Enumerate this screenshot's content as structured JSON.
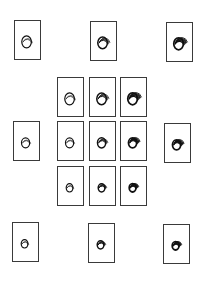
{
  "figure": {
    "outer_tiles": [
      {
        "id": "top-left",
        "x": 14,
        "y": 20,
        "arcs": 3,
        "weight": 0.9,
        "scale": 1.0
      },
      {
        "id": "top-center",
        "x": 90,
        "y": 21,
        "arcs": 5,
        "weight": 1.2,
        "scale": 1.0
      },
      {
        "id": "top-right",
        "x": 166,
        "y": 22,
        "arcs": 7,
        "weight": 1.5,
        "scale": 1.0
      },
      {
        "id": "middle-left",
        "x": 13,
        "y": 121,
        "arcs": 3,
        "weight": 0.9,
        "scale": 0.85
      },
      {
        "id": "middle-right",
        "x": 164,
        "y": 123,
        "arcs": 7,
        "weight": 1.5,
        "scale": 0.85
      },
      {
        "id": "bottom-left",
        "x": 12,
        "y": 222,
        "arcs": 3,
        "weight": 0.9,
        "scale": 0.7
      },
      {
        "id": "bottom-center",
        "x": 88,
        "y": 223,
        "arcs": 5,
        "weight": 1.2,
        "scale": 0.7
      },
      {
        "id": "bottom-right",
        "x": 163,
        "y": 224,
        "arcs": 7,
        "weight": 1.5,
        "scale": 0.7
      }
    ],
    "center_grid": [
      {
        "id": "grid-r1-c1",
        "x": 57,
        "y": 77,
        "arcs": 3,
        "weight": 0.9,
        "scale": 1.0
      },
      {
        "id": "grid-r1-c2",
        "x": 89,
        "y": 77,
        "arcs": 5,
        "weight": 1.2,
        "scale": 1.0
      },
      {
        "id": "grid-r1-c3",
        "x": 120,
        "y": 77,
        "arcs": 7,
        "weight": 1.5,
        "scale": 1.0
      },
      {
        "id": "grid-r2-c1",
        "x": 57,
        "y": 121,
        "arcs": 3,
        "weight": 0.9,
        "scale": 0.85
      },
      {
        "id": "grid-r2-c2",
        "x": 89,
        "y": 121,
        "arcs": 5,
        "weight": 1.2,
        "scale": 0.85
      },
      {
        "id": "grid-r2-c3",
        "x": 120,
        "y": 121,
        "arcs": 7,
        "weight": 1.5,
        "scale": 0.85
      },
      {
        "id": "grid-r3-c1",
        "x": 57,
        "y": 166,
        "arcs": 3,
        "weight": 0.9,
        "scale": 0.7
      },
      {
        "id": "grid-r3-c2",
        "x": 89,
        "y": 166,
        "arcs": 5,
        "weight": 1.2,
        "scale": 0.7
      },
      {
        "id": "grid-r3-c3",
        "x": 120,
        "y": 166,
        "arcs": 7,
        "weight": 1.5,
        "scale": 0.7
      }
    ],
    "colors": {
      "border": "#3a3a3a",
      "stroke": "#111111",
      "background": "#ffffff"
    }
  }
}
